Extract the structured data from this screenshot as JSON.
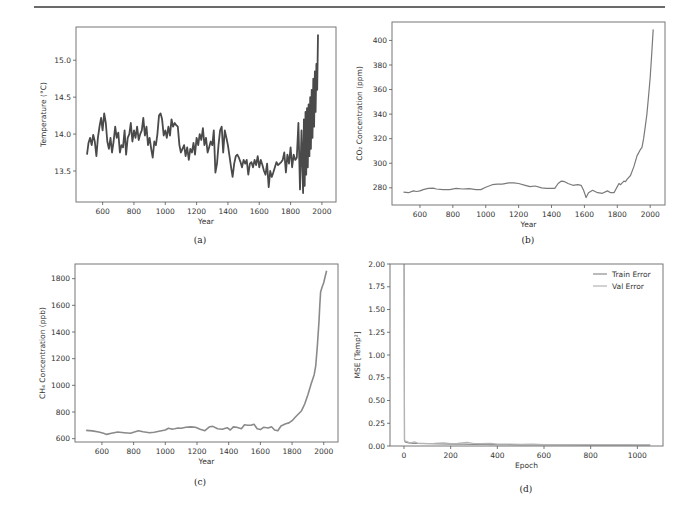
{
  "figure": {
    "captions": [
      "(a)",
      "(b)",
      "(c)",
      "(d)"
    ]
  },
  "chart_data": [
    {
      "id": "a",
      "type": "line",
      "title": "",
      "xlabel": "Year",
      "ylabel": "Temperature (°C)",
      "xlim": [
        430,
        2090
      ],
      "ylim": [
        13.08,
        15.45
      ],
      "xticks": [
        600,
        800,
        1000,
        1200,
        1400,
        1600,
        1800,
        2000
      ],
      "yticks": [
        13.5,
        14.0,
        14.5,
        15.0
      ],
      "ytick_labels": [
        "13.5",
        "14.0",
        "14.5",
        "15.0"
      ],
      "grid": false,
      "color": "#4a4a4a",
      "line_width": 1.8,
      "series": [
        {
          "name": "Temperature",
          "x": [
            500,
            510,
            520,
            530,
            540,
            550,
            560,
            570,
            580,
            590,
            600,
            610,
            620,
            630,
            640,
            650,
            660,
            670,
            680,
            690,
            700,
            710,
            720,
            730,
            740,
            750,
            760,
            770,
            780,
            790,
            800,
            810,
            820,
            830,
            840,
            850,
            860,
            870,
            880,
            890,
            900,
            910,
            920,
            930,
            940,
            950,
            960,
            970,
            980,
            990,
            1000,
            1010,
            1020,
            1030,
            1040,
            1050,
            1060,
            1070,
            1080,
            1090,
            1100,
            1110,
            1120,
            1130,
            1140,
            1150,
            1160,
            1170,
            1180,
            1190,
            1200,
            1210,
            1220,
            1230,
            1240,
            1250,
            1260,
            1270,
            1280,
            1290,
            1300,
            1310,
            1320,
            1330,
            1340,
            1350,
            1360,
            1370,
            1380,
            1390,
            1400,
            1410,
            1420,
            1430,
            1440,
            1450,
            1460,
            1470,
            1480,
            1490,
            1500,
            1510,
            1520,
            1530,
            1540,
            1550,
            1560,
            1570,
            1580,
            1590,
            1600,
            1610,
            1620,
            1630,
            1640,
            1650,
            1660,
            1670,
            1680,
            1690,
            1700,
            1710,
            1720,
            1730,
            1740,
            1750,
            1760,
            1770,
            1780,
            1790,
            1800,
            1810,
            1820,
            1830,
            1840,
            1850,
            1860,
            1870,
            1880,
            1885,
            1890,
            1895,
            1900,
            1905,
            1910,
            1915,
            1920,
            1925,
            1930,
            1935,
            1940,
            1945,
            1950,
            1955,
            1960,
            1965,
            1970,
            1975,
            1980,
            1985,
            1990,
            1995,
            2000,
            2005,
            2010,
            2015,
            2018
          ],
          "y": [
            13.72,
            13.88,
            13.95,
            13.85,
            13.99,
            13.9,
            13.7,
            13.95,
            14.1,
            14.22,
            14.05,
            14.28,
            14.15,
            13.9,
            13.8,
            13.95,
            13.75,
            13.9,
            14.1,
            13.95,
            14.02,
            13.75,
            13.85,
            13.82,
            14.05,
            13.72,
            13.95,
            14.0,
            14.15,
            13.9,
            14.05,
            13.95,
            14.1,
            13.92,
            14.0,
            14.05,
            14.22,
            13.98,
            14.1,
            13.85,
            13.95,
            13.8,
            13.68,
            13.9,
            13.85,
            14.0,
            14.25,
            14.28,
            14.2,
            13.98,
            14.05,
            13.95,
            14.1,
            13.98,
            14.2,
            14.1,
            14.15,
            14.12,
            14.1,
            13.85,
            13.75,
            13.8,
            13.85,
            13.7,
            13.82,
            13.65,
            13.8,
            13.75,
            13.88,
            13.72,
            13.95,
            13.85,
            14.0,
            13.92,
            14.08,
            13.85,
            13.95,
            13.75,
            13.82,
            13.9,
            13.85,
            14.05,
            13.48,
            13.6,
            13.85,
            14.05,
            14.1,
            13.75,
            14.05,
            13.95,
            13.85,
            13.7,
            13.55,
            13.42,
            13.6,
            13.7,
            13.72,
            13.68,
            13.62,
            13.55,
            13.65,
            13.6,
            13.65,
            13.45,
            13.6,
            13.62,
            13.55,
            13.65,
            13.58,
            13.7,
            13.55,
            13.65,
            13.58,
            13.5,
            13.45,
            13.6,
            13.28,
            13.5,
            13.42,
            13.48,
            13.55,
            13.62,
            13.58,
            13.6,
            13.62,
            13.65,
            13.75,
            13.48,
            13.72,
            13.6,
            13.82,
            13.55,
            13.72,
            13.65,
            13.68,
            14.15,
            13.25,
            14.05,
            13.2,
            14.2,
            13.3,
            14.3,
            13.45,
            14.35,
            13.55,
            14.4,
            13.7,
            14.5,
            13.8,
            14.6,
            13.95,
            14.75,
            14.1,
            14.85,
            14.3,
            14.95,
            14.6,
            15.35
          ]
        }
      ]
    },
    {
      "id": "b",
      "type": "line",
      "title": "",
      "xlabel": "Year",
      "ylabel": "CO₂ Concentration (ppm)",
      "xlim": [
        430,
        2090
      ],
      "ylim": [
        266,
        415
      ],
      "xticks": [
        600,
        800,
        1000,
        1200,
        1400,
        1600,
        1800,
        2000
      ],
      "yticks": [
        280,
        300,
        320,
        340,
        360,
        380,
        400
      ],
      "grid": false,
      "color": "#7a7a7a",
      "line_width": 1.2,
      "series": [
        {
          "name": "CO2",
          "x": [
            500,
            530,
            560,
            580,
            600,
            620,
            650,
            680,
            700,
            740,
            780,
            820,
            860,
            900,
            940,
            970,
            1000,
            1040,
            1070,
            1100,
            1140,
            1170,
            1200,
            1240,
            1270,
            1300,
            1340,
            1370,
            1400,
            1420,
            1440,
            1460,
            1480,
            1500,
            1530,
            1560,
            1580,
            1595,
            1610,
            1625,
            1650,
            1680,
            1710,
            1740,
            1760,
            1780,
            1800,
            1810,
            1820,
            1840,
            1850,
            1860,
            1880,
            1900,
            1920,
            1940,
            1950,
            1960,
            1970,
            1980,
            1990,
            2000,
            2010,
            2018
          ],
          "y": [
            276.5,
            276,
            277.5,
            277,
            277.5,
            278.5,
            279.5,
            279.7,
            279,
            278.5,
            278.5,
            279.5,
            279,
            279.3,
            278.5,
            278.5,
            280.5,
            282.5,
            283,
            283,
            284,
            284,
            283.5,
            282,
            281,
            281.5,
            280,
            279.5,
            279.5,
            279.5,
            283.5,
            285.5,
            285,
            283.5,
            282,
            282.5,
            282,
            278,
            272,
            276,
            278,
            276,
            275.5,
            277.5,
            276,
            276,
            281,
            283.5,
            282.5,
            285.5,
            285,
            287,
            290,
            297,
            306,
            311,
            313,
            320,
            330,
            340,
            355,
            370,
            390,
            409
          ]
        }
      ]
    },
    {
      "id": "c",
      "type": "line",
      "title": "",
      "xlabel": "Year",
      "ylabel": "CH₄ Concentration (ppb)",
      "xlim": [
        430,
        2090
      ],
      "ylim": [
        575,
        1910
      ],
      "xticks": [
        600,
        800,
        1000,
        1200,
        1400,
        1600,
        1800,
        2000
      ],
      "yticks": [
        600,
        800,
        1000,
        1200,
        1400,
        1600,
        1800
      ],
      "grid": false,
      "color": "#8a8a8a",
      "line_width": 1.6,
      "series": [
        {
          "name": "CH4",
          "x": [
            500,
            540,
            580,
            610,
            630,
            660,
            700,
            740,
            780,
            800,
            830,
            860,
            900,
            930,
            960,
            1000,
            1020,
            1040,
            1060,
            1080,
            1100,
            1130,
            1160,
            1190,
            1220,
            1250,
            1280,
            1300,
            1330,
            1360,
            1390,
            1410,
            1430,
            1450,
            1480,
            1500,
            1520,
            1540,
            1560,
            1580,
            1600,
            1620,
            1650,
            1670,
            1690,
            1710,
            1730,
            1740,
            1760,
            1780,
            1800,
            1820,
            1840,
            1860,
            1880,
            1900,
            1920,
            1940,
            1950,
            1960,
            1970,
            1975,
            1980,
            1990,
            2000,
            2010,
            2018
          ],
          "y": [
            662,
            658,
            650,
            640,
            632,
            640,
            650,
            645,
            640,
            648,
            660,
            652,
            645,
            648,
            655,
            665,
            678,
            672,
            675,
            680,
            678,
            686,
            688,
            685,
            670,
            660,
            690,
            692,
            675,
            670,
            682,
            665,
            688,
            685,
            675,
            705,
            700,
            700,
            708,
            675,
            668,
            685,
            680,
            690,
            665,
            660,
            695,
            700,
            712,
            718,
            735,
            760,
            785,
            810,
            860,
            930,
            1010,
            1080,
            1150,
            1300,
            1480,
            1600,
            1700,
            1740,
            1770,
            1820,
            1860
          ]
        }
      ]
    },
    {
      "id": "d",
      "type": "line",
      "title": "",
      "xlabel": "Epoch",
      "ylabel": "MSE [Temp²]",
      "xlim": [
        -60,
        1110
      ],
      "ylim": [
        0.0,
        2.0
      ],
      "xticks": [
        0,
        200,
        400,
        600,
        800,
        1000
      ],
      "yticks": [
        0.0,
        0.25,
        0.5,
        0.75,
        1.0,
        1.25,
        1.5,
        1.75,
        2.0
      ],
      "ytick_labels": [
        "0.00",
        "0.25",
        "0.50",
        "0.75",
        "1.00",
        "1.25",
        "1.50",
        "1.75",
        "2.00"
      ],
      "grid": false,
      "legend": {
        "position": "upper right",
        "entries": [
          "Train Error",
          "Val Error"
        ]
      },
      "series": [
        {
          "name": "Train Error",
          "color": "#8c8c8c",
          "x": [
            0,
            2,
            5,
            10,
            20,
            40,
            60,
            100,
            150,
            200,
            250,
            300,
            350,
            400,
            500,
            600,
            700,
            800,
            900,
            1000,
            1055
          ],
          "y": [
            2.6,
            0.06,
            0.045,
            0.04,
            0.035,
            0.03,
            0.028,
            0.025,
            0.023,
            0.02,
            0.02,
            0.018,
            0.016,
            0.015,
            0.013,
            0.012,
            0.011,
            0.01,
            0.01,
            0.009,
            0.009
          ]
        },
        {
          "name": "Val Error",
          "color": "#b4b4b4",
          "x": [
            0,
            2,
            5,
            10,
            20,
            30,
            45,
            60,
            80,
            100,
            130,
            170,
            200,
            230,
            270,
            300,
            330,
            370,
            400,
            450,
            500,
            550,
            600,
            650,
            700,
            750,
            800,
            850,
            900,
            950,
            1000,
            1055
          ],
          "y": [
            2.6,
            0.07,
            0.05,
            0.05,
            0.04,
            0.035,
            0.045,
            0.03,
            0.03,
            0.028,
            0.03,
            0.035,
            0.025,
            0.03,
            0.04,
            0.028,
            0.025,
            0.03,
            0.02,
            0.022,
            0.018,
            0.02,
            0.017,
            0.016,
            0.015,
            0.016,
            0.014,
            0.015,
            0.014,
            0.015,
            0.013,
            0.012
          ]
        }
      ]
    }
  ]
}
